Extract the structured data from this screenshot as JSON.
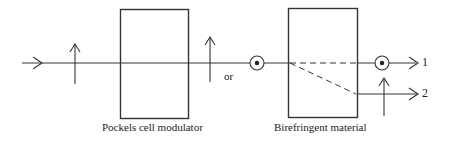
{
  "diagram": {
    "labels": {
      "pockels": "Pockels cell modulator",
      "birefringent": "Birefringent material",
      "or": "or",
      "output1": "1",
      "output2": "2"
    },
    "colors": {
      "stroke": "#333333",
      "background": "#ffffff"
    },
    "elements": [
      {
        "type": "input-beam",
        "direction": "right"
      },
      {
        "type": "polarization-vertical",
        "position": "before-modulator"
      },
      {
        "type": "box",
        "name": "Pockels cell modulator"
      },
      {
        "type": "polarization-vertical",
        "position": "after-modulator"
      },
      {
        "type": "polarization-out-of-plane",
        "position": "after-modulator"
      },
      {
        "type": "box",
        "name": "Birefringent material"
      },
      {
        "type": "output-beam",
        "label": "1",
        "polarization": "out-of-plane"
      },
      {
        "type": "output-beam",
        "label": "2",
        "polarization": "vertical"
      }
    ]
  }
}
